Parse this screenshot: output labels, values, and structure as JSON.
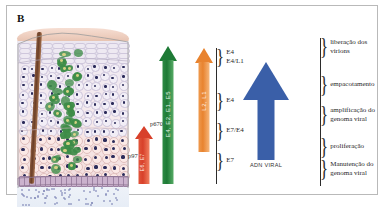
{
  "figure": {
    "panel_label": "B"
  },
  "arrows": {
    "red": {
      "inner_label": "E6, E7",
      "left_label": "p97",
      "right_label": "p670"
    },
    "green": {
      "inner_label": "E4, E2, E1, E5"
    },
    "orange": {
      "inner_label": "L2, L1"
    },
    "blue": {
      "caption": "ADN VIRAL"
    }
  },
  "genes": [
    {
      "text": "E4\nE4/L1"
    },
    {
      "text": "E4"
    },
    {
      "text": "E7/E4"
    },
    {
      "text": "E7"
    }
  ],
  "processes": [
    {
      "text": "liberação dos\nvirions"
    },
    {
      "text": "empacotamento"
    },
    {
      "text": "amplificação do\ngenoma viral"
    },
    {
      "text": "proliferação"
    },
    {
      "text": "Manutenção do\ngenoma viral"
    }
  ],
  "tissue": {
    "layers": [
      "surface",
      "cornified-layer",
      "spinous-layer",
      "basal-layer",
      "basement-membrane",
      "dermis"
    ],
    "follicle": "hair-follicle",
    "infected_cells_color": "#3d8c47",
    "nucleus_color": "#2b2b5a"
  },
  "colors": {
    "red_arrow": "#d8402a",
    "green_arrow": "#1e7a36",
    "orange_arrow": "#e8832f",
    "blue_arrow": "#3a5fa8",
    "frame_border": "#b9b9b9"
  }
}
